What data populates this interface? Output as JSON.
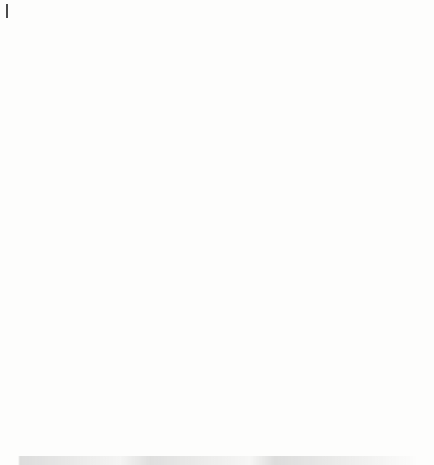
{
  "figure": {
    "axis_label_y": "Number of claims",
    "axis_label_x": "Year",
    "y_ticks": [
      "0",
      "50",
      "100",
      "150"
    ],
    "x_ticks": [
      "2000",
      "2002",
      "2004",
      "2006",
      "2008",
      "2010",
      "2012",
      "2014"
    ],
    "colors": {
      "axis": "#6b6b6b",
      "observed": "#1c1c1c",
      "poisson": "#9a9a9a",
      "negbin": "#2b2b2b",
      "frame": "#7a7a7a"
    }
  },
  "legend": {
    "items": [
      {
        "label": "Poisson",
        "marker": "dotted-line-with-dot",
        "color": "#9a9a9a"
      },
      {
        "label": "Neg. Bin.",
        "marker": "solid-line-with-dot",
        "color": "#2b2b2b"
      }
    ]
  },
  "chart_data": [
    {
      "type": "line",
      "id": "observed-claims",
      "title": "",
      "xlabel": "Year",
      "ylabel": "Number of claims",
      "xlim": [
        1999.4,
        2014.6
      ],
      "ylim": [
        0,
        158
      ],
      "y_ticks": [
        0,
        50,
        100,
        150
      ],
      "x_ticks": [
        2000,
        2002,
        2004,
        2006,
        2008,
        2010,
        2012,
        2014
      ],
      "grid": false,
      "legend": "none",
      "categories": [
        2000,
        2001,
        2002,
        2003,
        2004,
        2005,
        2006,
        2007,
        2008,
        2009,
        2010,
        2011,
        2012,
        2013,
        2014
      ],
      "series": [
        {
          "name": "Number of claims",
          "values": [
            97,
            126,
            97,
            130,
            84,
            74,
            80,
            108,
            98,
            106,
            90,
            92,
            122,
            150,
            102
          ]
        }
      ]
    },
    {
      "type": "line",
      "id": "claims-with-prediction-intervals",
      "title": "",
      "xlabel": "Year",
      "ylabel": "Number of claims",
      "xlim": [
        1999.4,
        2014.6
      ],
      "ylim": [
        0,
        158
      ],
      "y_ticks": [
        0,
        50,
        100,
        150
      ],
      "x_ticks": [
        2000,
        2002,
        2004,
        2006,
        2008,
        2010,
        2012,
        2014
      ],
      "grid": false,
      "legend": "bottom-right",
      "categories": [
        2000,
        2001,
        2002,
        2003,
        2004,
        2005,
        2006,
        2007,
        2008,
        2009,
        2010,
        2011,
        2012,
        2013,
        2014
      ],
      "series": [
        {
          "name": "Observed",
          "style": "points",
          "color": "#1c1c1c",
          "values": [
            97,
            126,
            97,
            130,
            84,
            74,
            80,
            108,
            98,
            106,
            90,
            92,
            122,
            150,
            102
          ]
        },
        {
          "name": "Neg. Bin. fit",
          "style": "solid",
          "color": "#2b2b2b",
          "values": [
            105,
            103,
            102,
            100,
            98,
            97,
            96,
            96,
            97,
            99,
            103,
            107,
            111,
            116,
            120
          ]
        },
        {
          "name": "Neg. Bin. upper",
          "style": "dashed",
          "color": "#2b2b2b",
          "values": [
            132,
            124,
            117,
            113,
            110,
            108,
            108,
            108,
            110,
            113,
            116,
            121,
            128,
            137,
            147
          ]
        },
        {
          "name": "Neg. Bin. lower",
          "style": "dashed",
          "color": "#2b2b2b",
          "values": [
            83,
            86,
            87,
            86,
            85,
            84,
            81,
            85,
            86,
            88,
            90,
            93,
            96,
            96,
            94
          ]
        },
        {
          "name": "Poisson fit",
          "style": "dotted",
          "color": "#9a9a9a",
          "values": [
            102,
            102,
            102,
            102,
            102,
            102,
            102,
            102,
            103,
            103,
            104,
            104,
            105,
            105,
            105
          ]
        },
        {
          "name": "Poisson upper",
          "style": "dotted",
          "color": "#9a9a9a",
          "values": [
            121,
            125,
            133,
            129,
            98,
            86,
            108,
            111,
            121,
            117,
            117,
            122,
            144,
            156,
            128
          ]
        },
        {
          "name": "Poisson lower",
          "style": "dotted",
          "color": "#9a9a9a",
          "values": [
            84,
            96,
            107,
            100,
            76,
            63,
            71,
            108,
            86,
            88,
            79,
            80,
            96,
            121,
            90
          ]
        }
      ]
    }
  ]
}
